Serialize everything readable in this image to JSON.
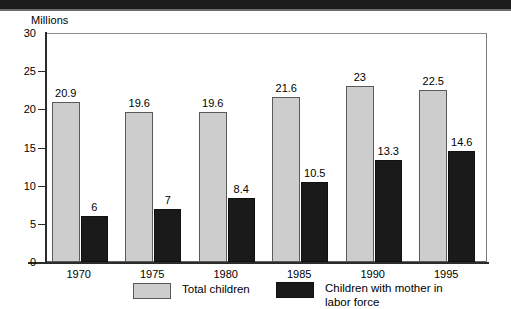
{
  "chart_data": {
    "type": "bar",
    "title": "",
    "subtitle": "",
    "xlabel": "",
    "ylabel": "Millions",
    "ylim": [
      0,
      30
    ],
    "yticks": [
      0,
      5,
      10,
      15,
      20,
      25,
      30
    ],
    "ytick_labels": [
      "0",
      "5",
      "10",
      "15",
      "20",
      "25",
      "30"
    ],
    "grid": false,
    "legend_position": "bottom",
    "categories": [
      "1970",
      "1975",
      "1980",
      "1985",
      "1990",
      "1995"
    ],
    "series": [
      {
        "name": "Total children",
        "color": "#cdcdcd",
        "values": [
          20.9,
          19.6,
          19.6,
          21.6,
          23,
          22.5
        ],
        "value_labels": [
          "20.9",
          "19.6",
          "19.6",
          "21.6",
          "23",
          "22.5"
        ]
      },
      {
        "name": "Children with mother in labor force",
        "color": "#1a1a1a",
        "values": [
          6,
          7,
          8.4,
          10.5,
          13.3,
          14.6
        ],
        "value_labels": [
          "6",
          "7",
          "8.4",
          "10.5",
          "13.3",
          "14.6"
        ]
      }
    ]
  },
  "axis": {
    "y_title": "Millions"
  },
  "legend": {
    "items": [
      {
        "label": "Total children",
        "swatch": "total"
      },
      {
        "label": "Children with mother in\nlabor force",
        "swatch": "labor"
      }
    ]
  }
}
